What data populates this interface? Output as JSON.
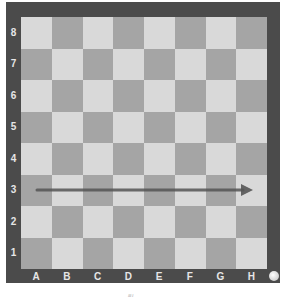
{
  "board": {
    "ranks": [
      "8",
      "7",
      "6",
      "5",
      "4",
      "3",
      "2",
      "1"
    ],
    "files": [
      "A",
      "B",
      "C",
      "D",
      "E",
      "F",
      "G",
      "H"
    ],
    "colors": {
      "frame": "#4b4b4b",
      "light": "#d9d9d9",
      "dark": "#a5a5a5",
      "label": "#e6e6e6",
      "arrow": "#555555"
    },
    "arrow": {
      "from": "a3",
      "to": "h3"
    }
  },
  "caption": "ⅈⅈⅈⅈ"
}
